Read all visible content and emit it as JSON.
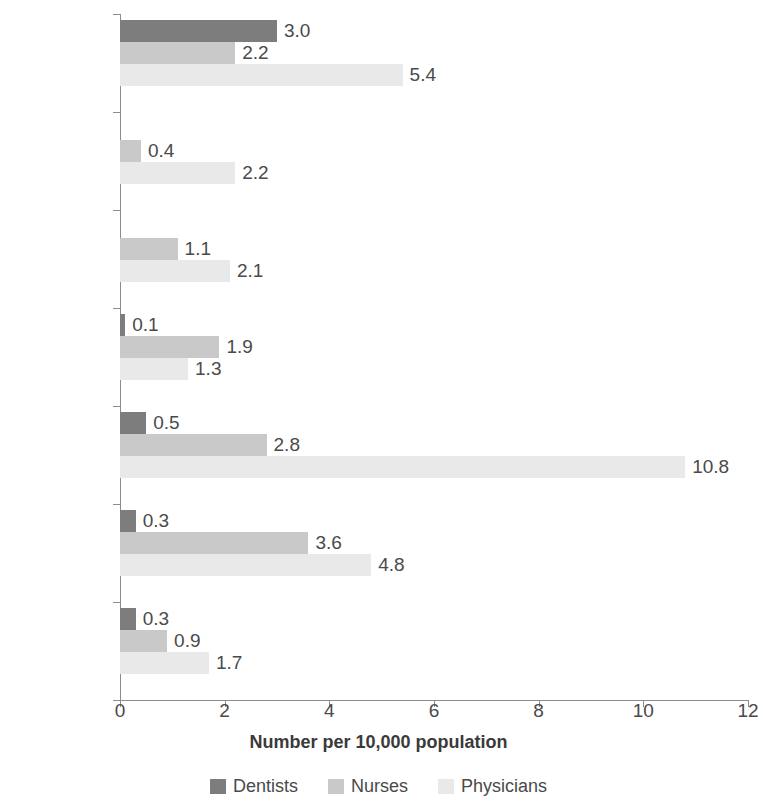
{
  "chart_data": {
    "type": "bar",
    "orientation": "horizontal",
    "grouped": true,
    "title": "",
    "xlabel": "Number per 10,000 population",
    "ylabel": "",
    "xlim": [
      0,
      12
    ],
    "xticks": [
      0,
      2,
      4,
      6,
      8,
      10,
      12
    ],
    "xtick_labels": [
      "0",
      "2",
      "4",
      "6",
      "8",
      "10",
      "12"
    ],
    "grid": false,
    "legend_position": "bottom",
    "categories": [
      "National",
      "Sylhet",
      "Rajshahi",
      "Khulna",
      "Dhaka",
      "Chittagong",
      "Barisal"
    ],
    "series": [
      {
        "name": "Dentists",
        "color": "#7d7d7d",
        "values": [
          3.0,
          null,
          null,
          0.1,
          0.5,
          0.3,
          0.3
        ],
        "labels": [
          "3.0",
          "",
          "",
          "0.1",
          "0.5",
          "0.3",
          "0.3"
        ]
      },
      {
        "name": "Nurses",
        "color": "#c9c9c9",
        "values": [
          2.2,
          0.4,
          1.1,
          1.9,
          2.8,
          3.6,
          0.9
        ],
        "labels": [
          "2.2",
          "0.4",
          "1.1",
          "1.9",
          "2.8",
          "3.6",
          "0.9"
        ]
      },
      {
        "name": "Physicians",
        "color": "#e9e9e9",
        "values": [
          5.4,
          2.2,
          2.1,
          1.3,
          10.8,
          4.8,
          1.7
        ],
        "labels": [
          "5.4",
          "2.2",
          "2.1",
          "1.3",
          "10.8",
          "4.8",
          "1.7"
        ]
      }
    ]
  },
  "axis": {
    "x_title": "Number per 10,000 population",
    "tick_labels": [
      "0",
      "2",
      "4",
      "6",
      "8",
      "10",
      "12"
    ],
    "category_labels": [
      "National",
      "Sylhet",
      "Rajshahi",
      "Khulna",
      "Dhaka",
      "Chittagong",
      "Barisal"
    ]
  },
  "legend": {
    "items": [
      {
        "label": "Dentists",
        "color": "#7d7d7d"
      },
      {
        "label": "Nurses",
        "color": "#c9c9c9"
      },
      {
        "label": "Physicians",
        "color": "#e9e9e9"
      }
    ]
  },
  "colors": {
    "dentists": "#7d7d7d",
    "nurses": "#c9c9c9",
    "physicians": "#e9e9e9",
    "axis": "#8c8c8c",
    "text": "#4a4a4a",
    "background": "#ffffff"
  }
}
